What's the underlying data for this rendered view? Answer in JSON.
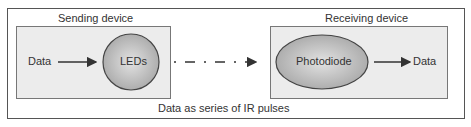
{
  "diagram": {
    "sender": {
      "title": "Sending device",
      "input_label": "Data",
      "emitter_label": "LEDs"
    },
    "receiver": {
      "title": "Receiving device",
      "detector_label": "Photodiode",
      "output_label": "Data"
    },
    "caption": "Data as series of IR pulses",
    "colors": {
      "box_fill": "#ececec",
      "shape_fill": "#c8c8c8",
      "stroke": "#555555"
    }
  }
}
